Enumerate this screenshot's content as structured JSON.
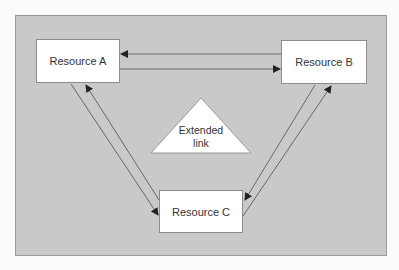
{
  "diagram": {
    "background_color": "#fbfbfb",
    "panel_color": "#c9c9c9",
    "nodes": [
      {
        "id": "A",
        "label": "Resource A"
      },
      {
        "id": "B",
        "label": "Resource B"
      },
      {
        "id": "C",
        "label": "Resource C"
      }
    ],
    "center": {
      "label_line1": "Extended",
      "label_line2": "link",
      "shape": "triangle"
    },
    "edges": [
      {
        "from": "B",
        "to": "A"
      },
      {
        "from": "A",
        "to": "B"
      },
      {
        "from": "A",
        "to": "C"
      },
      {
        "from": "C",
        "to": "A"
      },
      {
        "from": "B",
        "to": "C"
      },
      {
        "from": "C",
        "to": "B"
      }
    ]
  }
}
